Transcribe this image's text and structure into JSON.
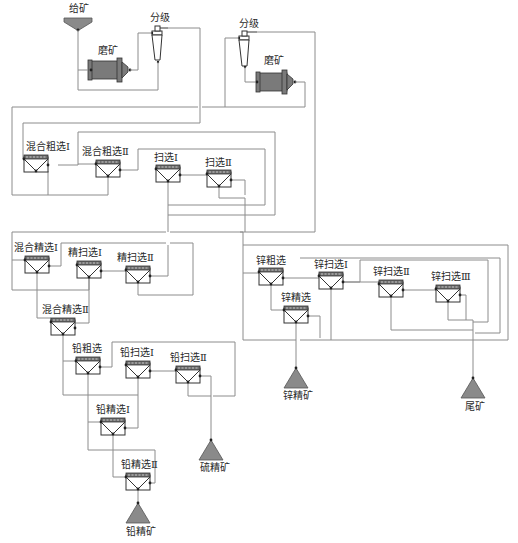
{
  "diagram": {
    "type": "flotation-flowsheet",
    "colors": {
      "line": "#8c8c8c",
      "equipment": "#333333",
      "fill": "#8a8a8a"
    },
    "labels": {
      "feed": "给矿",
      "mill_1": "磨矿",
      "classify_1": "分级",
      "classify_2": "分级",
      "mill_2": "磨矿",
      "bulk_rough_1": "混合粗选Ⅰ",
      "bulk_rough_2": "混合粗选Ⅱ",
      "scav_1": "扫选Ⅰ",
      "scav_2": "扫选Ⅱ",
      "bulk_clean_1": "混合精选Ⅰ",
      "clean_scav_1": "精扫选Ⅰ",
      "clean_scav_2": "精扫选Ⅱ",
      "bulk_clean_2": "混合精选Ⅱ",
      "pb_rough": "铅粗选",
      "pb_scav_1": "铅扫选Ⅰ",
      "pb_scav_2": "铅扫选Ⅱ",
      "pb_clean_1": "铅精选Ⅰ",
      "pb_clean_2": "铅精选Ⅱ",
      "zn_rough": "锌粗选",
      "zn_clean": "锌精选",
      "zn_scav_1": "锌扫选Ⅰ",
      "zn_scav_2": "锌扫选Ⅱ",
      "zn_scav_3": "锌扫选Ⅲ",
      "zn_conc": "锌精矿",
      "tailings": "尾矿",
      "s_conc": "硫精矿",
      "pb_conc": "铅精矿"
    },
    "cells": [
      {
        "id": "bulk_rough_1",
        "x": 24,
        "y": 155
      },
      {
        "id": "bulk_rough_2",
        "x": 96,
        "y": 160
      },
      {
        "id": "scav_1",
        "x": 156,
        "y": 165
      },
      {
        "id": "scav_2",
        "x": 207,
        "y": 170
      },
      {
        "id": "bulk_clean_1",
        "x": 25,
        "y": 256
      },
      {
        "id": "clean_scav_1",
        "x": 77,
        "y": 261
      },
      {
        "id": "clean_scav_2",
        "x": 126,
        "y": 266
      },
      {
        "id": "bulk_clean_2",
        "x": 51,
        "y": 318
      },
      {
        "id": "pb_rough",
        "x": 76,
        "y": 357
      },
      {
        "id": "pb_scav_1",
        "x": 126,
        "y": 361
      },
      {
        "id": "pb_scav_2",
        "x": 176,
        "y": 366
      },
      {
        "id": "pb_clean_1",
        "x": 101,
        "y": 418
      },
      {
        "id": "pb_clean_2",
        "x": 126,
        "y": 473
      },
      {
        "id": "zn_rough",
        "x": 259,
        "y": 268
      },
      {
        "id": "zn_clean",
        "x": 284,
        "y": 306
      },
      {
        "id": "zn_scav_1",
        "x": 319,
        "y": 272
      },
      {
        "id": "zn_scav_2",
        "x": 379,
        "y": 280
      },
      {
        "id": "zn_scav_3",
        "x": 436,
        "y": 285
      }
    ],
    "products": [
      {
        "id": "zn_conc",
        "x": 295,
        "y": 368
      },
      {
        "id": "tailings",
        "x": 473,
        "y": 378
      },
      {
        "id": "s_conc",
        "x": 213,
        "y": 440
      },
      {
        "id": "pb_conc",
        "x": 137,
        "y": 503
      }
    ]
  }
}
